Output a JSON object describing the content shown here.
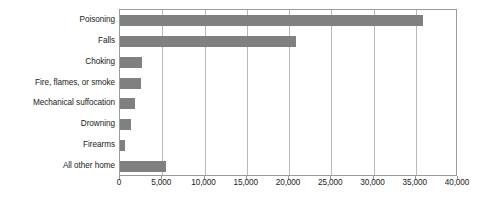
{
  "chart_data": {
    "type": "bar",
    "orientation": "horizontal",
    "title": "",
    "subtitle": "",
    "xlabel": "",
    "ylabel": "",
    "grid": "vertical",
    "legend": "none",
    "xlim": [
      0,
      40000
    ],
    "xticks": [
      0,
      5000,
      10000,
      15000,
      20000,
      25000,
      30000,
      35000,
      40000
    ],
    "xticklabels": [
      "0",
      "5,000",
      "10,000",
      "15,000",
      "20,000",
      "25,000",
      "30,000",
      "35,000",
      "40,000"
    ],
    "categories": [
      "Poisoning",
      "Falls",
      "Choking",
      "Fire, flames, or smoke",
      "Mechanical suffocation",
      "Drowning",
      "Firearms",
      "All other home"
    ],
    "values": [
      35900,
      20800,
      2600,
      2500,
      1750,
      1300,
      600,
      5400
    ],
    "bar_color": "#808080",
    "grid_color": "#b9b9b9",
    "frame_color": "#9a9a9a",
    "background": "#ffffff"
  }
}
